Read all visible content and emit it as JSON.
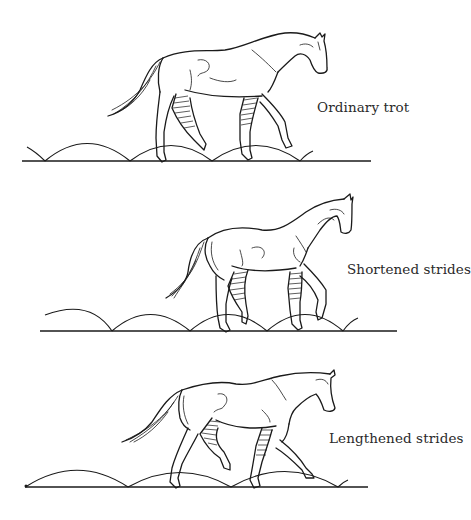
{
  "figure": {
    "panels": [
      {
        "id": "ordinary",
        "label": "Ordinary trot"
      },
      {
        "id": "shortened",
        "label": "Shortened strides"
      },
      {
        "id": "lengthened",
        "label": "Lengthened strides"
      }
    ]
  },
  "colors": {
    "ink": "#1a1a1a",
    "label_text": "#2a2a2a",
    "background": "#ffffff"
  }
}
